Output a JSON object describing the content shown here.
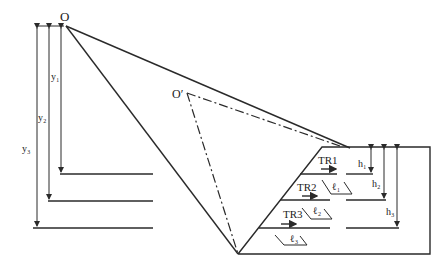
{
  "diagram": {
    "labels": {
      "O": "O",
      "O_prime": "O′",
      "y1": "y₁",
      "y2": "y₂",
      "y3": "y₃",
      "h1": "h₁",
      "h2": "h₂",
      "h3": "h₃",
      "TR1": "TR1",
      "TR2": "TR2",
      "TR3": "TR3",
      "l1": "ℓ₁",
      "l2": "ℓ₂",
      "l3": "ℓ₃"
    },
    "colors": {
      "line": "#2a2a2a",
      "background": "#ffffff"
    }
  }
}
